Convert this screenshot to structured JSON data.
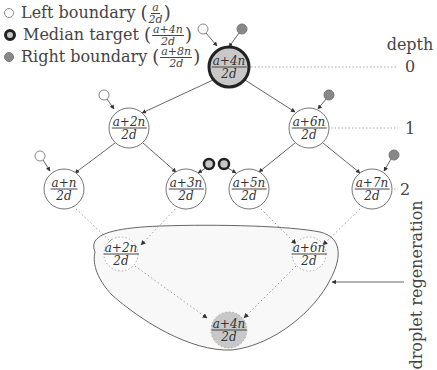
{
  "legend": {
    "items": [
      {
        "kind": "left",
        "label": "Left boundary",
        "num": "a",
        "den": "2d"
      },
      {
        "kind": "median",
        "label": "Median target",
        "num": "a+4n",
        "den": "2d"
      },
      {
        "kind": "right",
        "label": "Right boundary",
        "num": "a+8n",
        "den": "2d"
      }
    ]
  },
  "depth": {
    "title": "depth",
    "levels": [
      "0",
      "1",
      "2"
    ]
  },
  "tree": {
    "root": {
      "num": "a+4n",
      "den": "2d"
    },
    "level1": [
      {
        "num": "a+2n",
        "den": "2d"
      },
      {
        "num": "a+6n",
        "den": "2d"
      }
    ],
    "level2": [
      {
        "num": "a+n",
        "den": "2d"
      },
      {
        "num": "a+3n",
        "den": "2d"
      },
      {
        "num": "a+5n",
        "den": "2d"
      },
      {
        "num": "a+7n",
        "den": "2d"
      }
    ]
  },
  "regeneration": {
    "label": "droplet regeneration",
    "nodes": [
      {
        "num": "a+2n",
        "den": "2d"
      },
      {
        "num": "a+6n",
        "den": "2d"
      },
      {
        "num": "a+4n",
        "den": "2d"
      }
    ]
  },
  "colors": {
    "line": "#555555",
    "dotted": "#999999",
    "median_fill": "#c8c8c8",
    "right_fill": "#888888",
    "blob_fill": "#f7f7f7"
  }
}
